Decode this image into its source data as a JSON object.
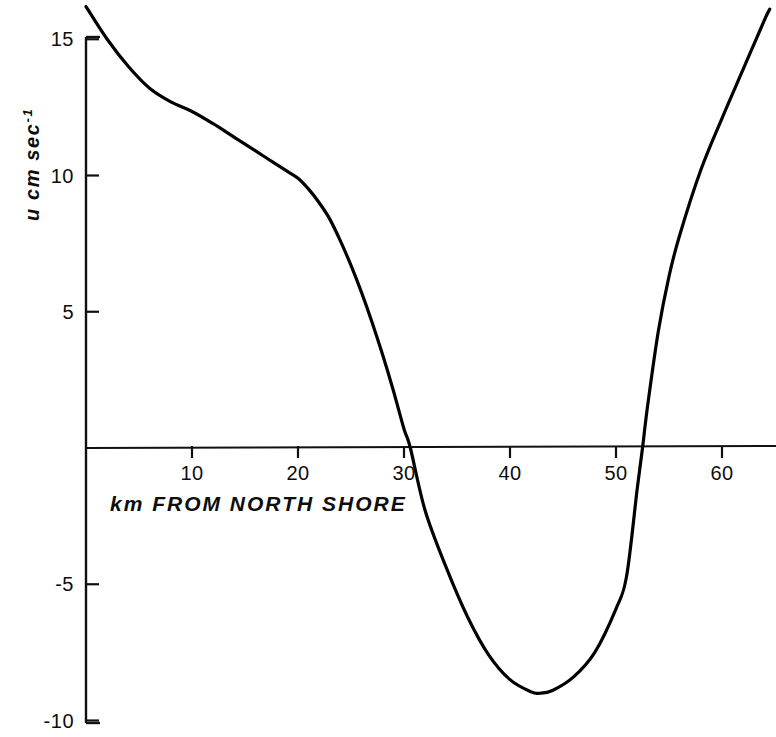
{
  "chart_data": {
    "type": "line",
    "title": "",
    "subtitle": "",
    "xlabel": "km FROM NORTH SHORE",
    "ylabel": "u cm sec",
    "ylabel_exponent": "-1",
    "xlim": [
      0,
      65
    ],
    "ylim": [
      -10,
      16.5
    ],
    "grid": false,
    "legend": null,
    "x_ticks": [
      10,
      20,
      30,
      40,
      50,
      60
    ],
    "x_tick_labels": [
      "10",
      "20",
      "30",
      "40",
      "50",
      "60"
    ],
    "y_ticks": [
      15,
      10,
      5,
      -5,
      -10
    ],
    "y_tick_labels": [
      "15",
      "10",
      "5",
      "-5",
      "-10"
    ],
    "zero_line": 0,
    "series": [
      {
        "name": "u velocity profile",
        "color": "#000000",
        "x": [
          0,
          2,
          4,
          6,
          8,
          10,
          12,
          14,
          16,
          18,
          19,
          20,
          21,
          22,
          23,
          24,
          25,
          26,
          27,
          28,
          29,
          30,
          30.6,
          32,
          34,
          36,
          38,
          40,
          42,
          42.8,
          44,
          46,
          48,
          50,
          51,
          52,
          52.5,
          53,
          54,
          55,
          56,
          58,
          60,
          62,
          64,
          64.5
        ],
        "y": [
          16.2,
          15.0,
          14.0,
          13.2,
          12.7,
          12.35,
          11.9,
          11.4,
          10.9,
          10.4,
          10.15,
          9.9,
          9.5,
          9.0,
          8.4,
          7.6,
          6.7,
          5.7,
          4.6,
          3.4,
          2.1,
          0.7,
          0.0,
          -2.3,
          -4.4,
          -6.2,
          -7.6,
          -8.5,
          -8.95,
          -9.0,
          -8.9,
          -8.4,
          -7.5,
          -5.9,
          -4.7,
          -1.5,
          0.0,
          1.6,
          4.3,
          6.3,
          7.8,
          10.2,
          12.1,
          13.9,
          15.7,
          16.1
        ]
      }
    ],
    "annotations": {
      "minimum": {
        "x": 42.8,
        "y": -9.0
      },
      "zero_crossings": [
        30.6,
        52.5
      ]
    }
  },
  "axis_labels": {
    "x_title": "k m   F R O M   N O R T H   S H O R E",
    "y_title": "u cm sec",
    "y_title_sup": "-1"
  },
  "ticks": {
    "x": [
      {
        "label": "10",
        "value": 10
      },
      {
        "label": "20",
        "value": 20
      },
      {
        "label": "30",
        "value": 30
      },
      {
        "label": "40",
        "value": 40
      },
      {
        "label": "50",
        "value": 50
      },
      {
        "label": "60",
        "value": 60
      }
    ],
    "y": [
      {
        "label": "15",
        "value": 15
      },
      {
        "label": "10",
        "value": 10
      },
      {
        "label": "5",
        "value": 5
      },
      {
        "label": "-5",
        "value": -5
      },
      {
        "label": "-10",
        "value": -10
      }
    ]
  },
  "style": {
    "line_color": "#000000",
    "axis_color": "#111111",
    "background": "#ffffff"
  }
}
